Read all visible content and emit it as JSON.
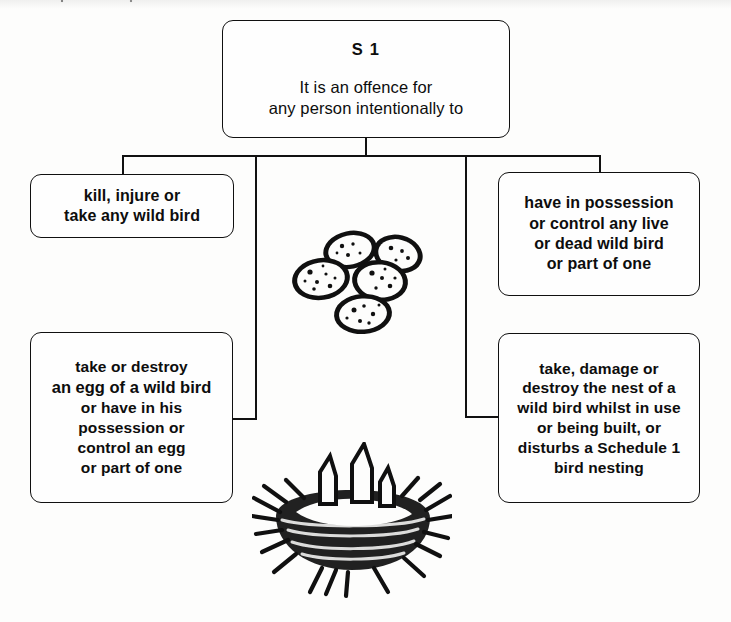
{
  "diagram": {
    "ink_color": "#111111",
    "paper_color": "#fdfdfc",
    "root": {
      "heading": "S 1",
      "lines": [
        "It is an offence for",
        "any person intentionally to"
      ]
    },
    "branches": [
      {
        "id": "kill-injure-take",
        "lines": [
          "kill, injure or",
          "take any wild bird"
        ]
      },
      {
        "id": "have-in-possession",
        "lines": [
          "have in possession",
          "or control any live",
          "or dead wild bird",
          "or part of one"
        ]
      },
      {
        "id": "take-or-destroy-egg",
        "lines": [
          "take or destroy",
          "an egg of a wild bird",
          "or have in his",
          "possession or",
          "control an egg",
          "or part of one"
        ]
      },
      {
        "id": "damage-destroy-nest",
        "lines": [
          "take, damage or",
          "destroy the nest of a",
          "wild bird whilst in use",
          "or being built, or",
          "disturbs a Schedule 1",
          "bird nesting"
        ]
      }
    ],
    "illustrations": [
      {
        "id": "eggs-illustration",
        "caption": "cluster of five speckled wild bird eggs"
      },
      {
        "id": "nest-illustration",
        "caption": "twig nest containing chicks with open beaks"
      }
    ]
  }
}
